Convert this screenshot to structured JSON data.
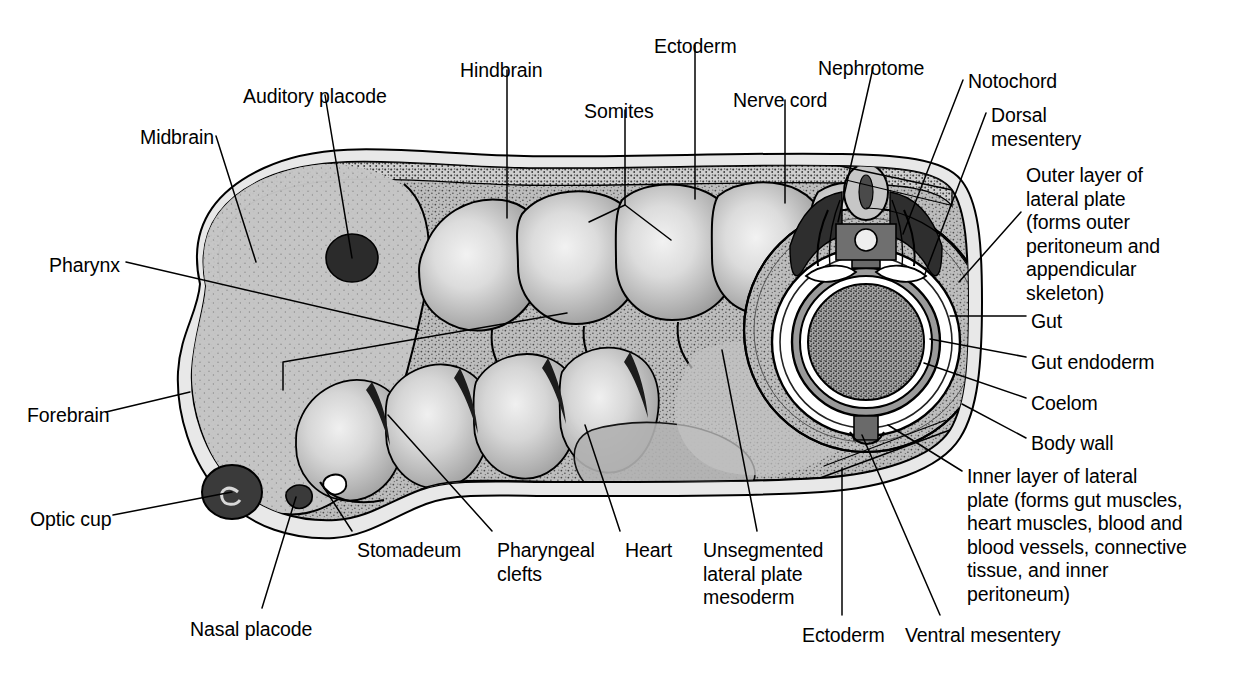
{
  "figure": {
    "background_color": "#ffffff",
    "line_color": "#000000",
    "colors": {
      "body_fill": "#b5b5b5",
      "body_fill_light": "#c9c9c9",
      "somite_highlight": "#efefef",
      "ectoderm_band": "#cfcfcf",
      "dark_structure": "#3a3a3a",
      "mid_gray": "#8a8a8a",
      "gut_fill": "#a8a8a8",
      "white": "#ffffff"
    }
  },
  "labels": [
    {
      "id": "midbrain",
      "text": "Midbrain",
      "align": "left",
      "x": 140,
      "y": 126
    },
    {
      "id": "auditory-placode",
      "text": "Auditory placode",
      "align": "left",
      "x": 243,
      "y": 85
    },
    {
      "id": "hindbrain",
      "text": "Hindbrain",
      "align": "left",
      "x": 460,
      "y": 59
    },
    {
      "id": "somites",
      "text": "Somites",
      "align": "left",
      "x": 584,
      "y": 100
    },
    {
      "id": "ectoderm-top",
      "text": "Ectoderm",
      "align": "left",
      "x": 654,
      "y": 35
    },
    {
      "id": "nerve-cord",
      "text": "Nerve cord",
      "align": "left",
      "x": 733,
      "y": 89
    },
    {
      "id": "nephrotome",
      "text": "Nephrotome",
      "align": "left",
      "x": 818,
      "y": 57
    },
    {
      "id": "notochord",
      "text": "Notochord",
      "align": "left",
      "x": 968,
      "y": 70
    },
    {
      "id": "dorsal-mesentery",
      "text": "Dorsal\nmesentery",
      "align": "left",
      "x": 991,
      "y": 104
    },
    {
      "id": "outer-layer",
      "text": "Outer layer of\nlateral plate\n(forms outer\nperitoneum and\nappendicular\nskeleton)",
      "align": "left",
      "x": 1026,
      "y": 164
    },
    {
      "id": "gut",
      "text": "Gut",
      "align": "left",
      "x": 1031,
      "y": 310
    },
    {
      "id": "gut-endoderm",
      "text": "Gut endoderm",
      "align": "left",
      "x": 1031,
      "y": 351
    },
    {
      "id": "coelom",
      "text": "Coelom",
      "align": "left",
      "x": 1031,
      "y": 392
    },
    {
      "id": "body-wall",
      "text": "Body wall",
      "align": "left",
      "x": 1031,
      "y": 432
    },
    {
      "id": "inner-layer",
      "text": "Inner layer of lateral\nplate (forms gut muscles,\nheart muscles, blood and\nblood vessels, connective\ntissue, and inner\nperitoneum)",
      "align": "left",
      "x": 967,
      "y": 465
    },
    {
      "id": "pharynx",
      "text": "Pharynx",
      "align": "left",
      "x": 49,
      "y": 254
    },
    {
      "id": "forebrain",
      "text": "Forebrain",
      "align": "left",
      "x": 27,
      "y": 404
    },
    {
      "id": "optic-cup",
      "text": "Optic cup",
      "align": "left",
      "x": 30,
      "y": 508
    },
    {
      "id": "nasal-placode",
      "text": "Nasal placode",
      "align": "left",
      "x": 190,
      "y": 618
    },
    {
      "id": "stomadeum",
      "text": "Stomadeum",
      "align": "left",
      "x": 357,
      "y": 539
    },
    {
      "id": "pharyngeal-clefts",
      "text": "Pharyngeal\nclefts",
      "align": "left",
      "x": 497,
      "y": 539
    },
    {
      "id": "heart",
      "text": "Heart",
      "align": "left",
      "x": 625,
      "y": 539
    },
    {
      "id": "unsegmented-lpm",
      "text": "Unsegmented\nlateral plate\nmesoderm",
      "align": "left",
      "x": 703,
      "y": 539
    },
    {
      "id": "ectoderm-bottom",
      "text": "Ectoderm",
      "align": "left",
      "x": 802,
      "y": 624
    },
    {
      "id": "ventral-mesentery",
      "text": "Ventral mesentery",
      "align": "left",
      "x": 905,
      "y": 624
    }
  ],
  "leader_lines": [
    {
      "id": "midbrain",
      "points": "216,136 256,262"
    },
    {
      "id": "auditory-placode",
      "points": "325,95 352,258"
    },
    {
      "id": "hindbrain",
      "points": "507,70 507,218"
    },
    {
      "id": "somites",
      "points": "625,110 625,205"
    },
    {
      "id": "somites-fork-a",
      "points": "625,205 589,222"
    },
    {
      "id": "somites-fork-b",
      "points": "625,205 671,240"
    },
    {
      "id": "ectoderm-top",
      "points": "695,45 695,199"
    },
    {
      "id": "nerve-cord",
      "points": "785,100 785,203"
    },
    {
      "id": "nephrotome",
      "points": "873,68 838,222"
    },
    {
      "id": "notochord",
      "points": "963,80 903,234"
    },
    {
      "id": "dorsal-mesentery",
      "points": "986,113 925,274"
    },
    {
      "id": "outer-layer",
      "points": "1021,212 959,282"
    },
    {
      "id": "gut",
      "points": "1026,316 950,316"
    },
    {
      "id": "gut-endoderm",
      "points": "1026,357 930,339"
    },
    {
      "id": "coelom",
      "points": "1026,398 924,363"
    },
    {
      "id": "body-wall",
      "points": "1026,438 962,404"
    },
    {
      "id": "inner-layer",
      "points": "962,471 888,425"
    },
    {
      "id": "pharynx",
      "points": "126,262 419,330"
    },
    {
      "id": "pharynx-elbow",
      "points": "283,390 283,362 567,313"
    },
    {
      "id": "forebrain",
      "points": "106,412 190,392"
    },
    {
      "id": "optic-cup",
      "points": "113,515 232,492"
    },
    {
      "id": "nasal-placode",
      "points": "262,608 296,497"
    },
    {
      "id": "stomadeum",
      "points": "352,531 321,483"
    },
    {
      "id": "pharyngeal-clefts",
      "points": "492,531 388,415"
    },
    {
      "id": "heart",
      "points": "620,531 585,425"
    },
    {
      "id": "unsegmented-lpm",
      "points": "757,531 722,350"
    },
    {
      "id": "ectoderm-bottom",
      "points": "842,615 842,468"
    },
    {
      "id": "ventral-mesentery",
      "points": "940,615 862,435"
    }
  ]
}
